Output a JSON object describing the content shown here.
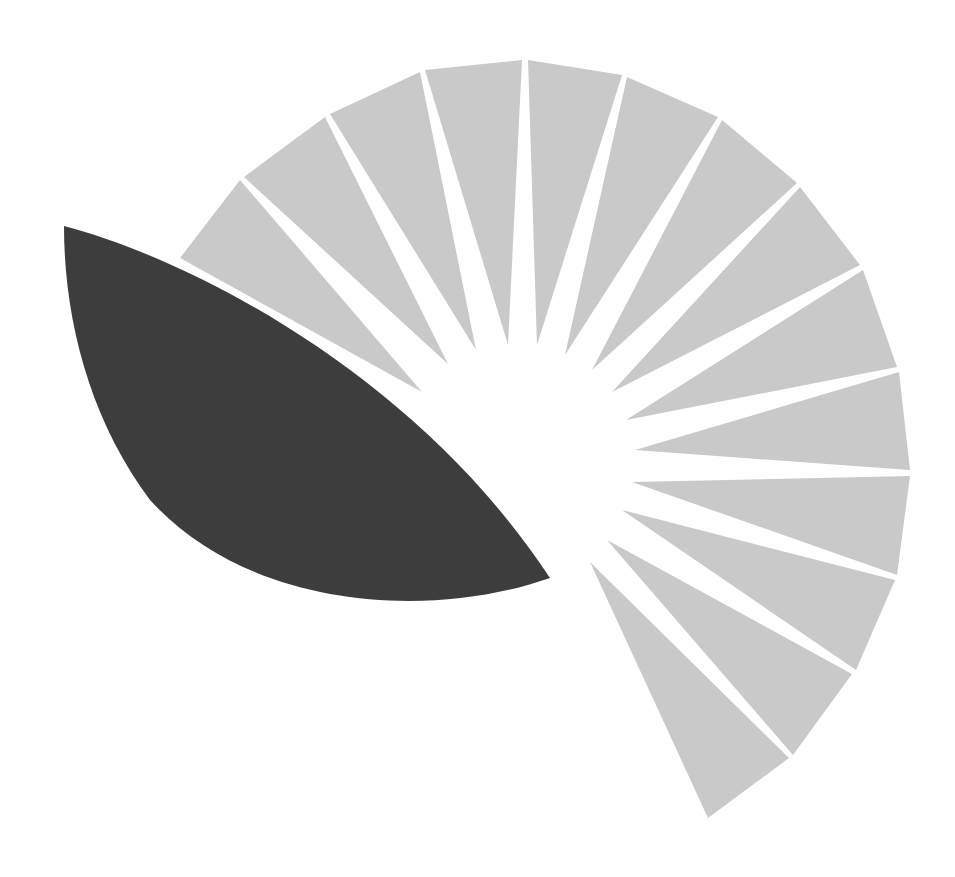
{
  "logo": {
    "name": "sunburst-leaf-logo",
    "colors": {
      "background": "#ffffff",
      "rays": "#c9c9c9",
      "leaf": "#3d3d3d"
    },
    "leaf_path": "M 64 226 C 200 262, 420 380, 550 578 C 430 620, 250 610, 150 500 C 90 420, 64 320, 64 226 Z",
    "rays": [
      {
        "points": "180,258 240,180 422,392"
      },
      {
        "points": "244,177 325,117 448,364"
      },
      {
        "points": "330,114 420,72 476,350"
      },
      {
        "points": "425,70 522,60 508,345"
      },
      {
        "points": "528,60 622,75 537,345"
      },
      {
        "points": "627,77 718,117 565,355"
      },
      {
        "points": "722,120 797,183 592,370"
      },
      {
        "points": "800,187 860,265 612,392"
      },
      {
        "points": "863,270 897,367 626,420"
      },
      {
        "points": "899,372 910,470 635,450"
      },
      {
        "points": "910,476 897,575 632,482"
      },
      {
        "points": "895,580 856,670 622,510"
      },
      {
        "points": "852,674 793,755 607,540"
      },
      {
        "points": "789,758 708,818 590,562"
      }
    ]
  }
}
